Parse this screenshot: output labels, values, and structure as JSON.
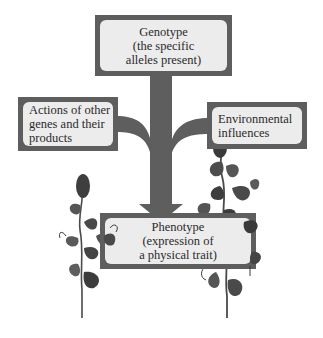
{
  "diagram": {
    "type": "flow-tree",
    "colors": {
      "box_border": "#5e5e5e",
      "box_fill": "#ececec",
      "trunk": "#5e5e5e",
      "text": "#2a2a2a",
      "plant_dark": "#3a3a3a",
      "plant_mid": "#6a6a6a"
    },
    "nodes": {
      "genotype": {
        "lines": [
          "Genotype",
          "(the specific",
          "alleles present)"
        ]
      },
      "other_genes": {
        "lines": [
          "Actions of other",
          "genes and their",
          "products"
        ]
      },
      "environment": {
        "lines": [
          "Environmental",
          "influences"
        ]
      },
      "phenotype": {
        "lines": [
          "Phenotype",
          "(expression of",
          "a physical trait)"
        ]
      }
    },
    "edges": [
      {
        "from": "genotype",
        "to": "phenotype"
      },
      {
        "from": "other_genes",
        "to": "phenotype"
      },
      {
        "from": "environment",
        "to": "phenotype"
      }
    ],
    "illustrations": [
      "pea-plant-left",
      "pea-plant-right"
    ]
  }
}
